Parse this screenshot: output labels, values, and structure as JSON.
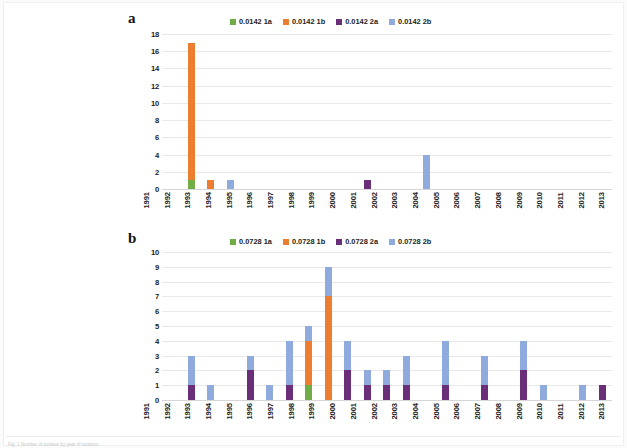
{
  "figure": {
    "caption": "Fig. 1 Number of isolates by year of isolation",
    "panel_a_letter": "a",
    "panel_b_letter": "b"
  },
  "colors": {
    "series_1a": "#70AD47",
    "series_1b": "#ED7D31",
    "series_2a": "#6B2F7A",
    "series_2b": "#8FAADC",
    "gridline": "#e9e9e9",
    "text": "#222222"
  },
  "chart_data": [
    {
      "type": "bar",
      "id": "panel-a",
      "panel": "a",
      "stacked": true,
      "title": "",
      "xlabel": "",
      "ylabel": "",
      "ylim": [
        0,
        18
      ],
      "ytick_step": 2,
      "yticks": [
        0,
        2,
        4,
        6,
        8,
        10,
        12,
        14,
        16,
        18
      ],
      "grid": true,
      "legend_position": "top",
      "categories": [
        "1991",
        "1992",
        "1993",
        "1994",
        "1995",
        "1996",
        "1997",
        "1998",
        "1999",
        "2000",
        "2001",
        "2002",
        "2003",
        "2004",
        "2005",
        "2006",
        "2007",
        "2008",
        "2009",
        "2010",
        "2011",
        "2012",
        "2013"
      ],
      "series": [
        {
          "name": "0.0142 1a",
          "color": "#70AD47",
          "values": [
            0,
            1,
            0,
            0,
            0,
            0,
            0,
            0,
            0,
            0,
            0,
            0,
            0,
            0,
            0,
            0,
            0,
            0,
            0,
            0,
            0,
            0,
            0
          ]
        },
        {
          "name": "0.0142 1b",
          "color": "#ED7D31",
          "values": [
            0,
            16,
            1,
            0,
            0,
            0,
            0,
            0,
            0,
            0,
            0,
            0,
            0,
            0,
            0,
            0,
            0,
            0,
            0,
            0,
            0,
            0,
            0
          ]
        },
        {
          "name": "0.0142 2a",
          "color": "#6B2F7A",
          "values": [
            0,
            0,
            0,
            0,
            0,
            0,
            0,
            0,
            0,
            0,
            1,
            0,
            0,
            0,
            0,
            0,
            0,
            0,
            0,
            0,
            0,
            0,
            0
          ]
        },
        {
          "name": "0.0142 2b",
          "color": "#8FAADC",
          "values": [
            0,
            0,
            0,
            1,
            0,
            0,
            0,
            0,
            0,
            0,
            0,
            0,
            0,
            4,
            0,
            0,
            0,
            0,
            0,
            0,
            0,
            0,
            0
          ]
        }
      ],
      "totals": [
        0,
        17,
        1,
        1,
        0,
        0,
        0,
        0,
        0,
        0,
        1,
        0,
        0,
        4,
        0,
        0,
        0,
        0,
        0,
        0,
        0,
        0,
        0
      ]
    },
    {
      "type": "bar",
      "id": "panel-b",
      "panel": "b",
      "stacked": true,
      "title": "",
      "xlabel": "",
      "ylabel": "",
      "ylim": [
        0,
        10
      ],
      "ytick_step": 1,
      "yticks": [
        0,
        1,
        2,
        3,
        4,
        5,
        6,
        7,
        8,
        9,
        10
      ],
      "grid": true,
      "legend_position": "top",
      "categories": [
        "1991",
        "1992",
        "1993",
        "1994",
        "1995",
        "1996",
        "1997",
        "1998",
        "1999",
        "2000",
        "2001",
        "2002",
        "2003",
        "2004",
        "2005",
        "2006",
        "2007",
        "2008",
        "2009",
        "2010",
        "2011",
        "2012",
        "2013"
      ],
      "series": [
        {
          "name": "0.0728 1a",
          "color": "#70AD47",
          "values": [
            0,
            0,
            0,
            0,
            0,
            0,
            0,
            1,
            0,
            0,
            0,
            0,
            0,
            0,
            0,
            0,
            0,
            0,
            0,
            0,
            0,
            0,
            0
          ]
        },
        {
          "name": "0.0728 1b",
          "color": "#ED7D31",
          "values": [
            0,
            0,
            0,
            0,
            0,
            0,
            0,
            3,
            7,
            0,
            0,
            0,
            0,
            0,
            0,
            0,
            0,
            0,
            0,
            0,
            0,
            0,
            0
          ]
        },
        {
          "name": "0.0728 2a",
          "color": "#6B2F7A",
          "values": [
            0,
            1,
            0,
            0,
            2,
            0,
            1,
            0,
            0,
            2,
            1,
            1,
            1,
            0,
            1,
            0,
            1,
            0,
            2,
            0,
            0,
            0,
            1
          ]
        },
        {
          "name": "0.0728 2b",
          "color": "#8FAADC",
          "values": [
            0,
            2,
            1,
            0,
            1,
            1,
            3,
            1,
            2,
            2,
            1,
            1,
            2,
            0,
            3,
            0,
            2,
            0,
            2,
            1,
            0,
            1,
            0
          ]
        }
      ],
      "totals": [
        0,
        3,
        1,
        0,
        3,
        1,
        4,
        5,
        9,
        4,
        2,
        2,
        3,
        0,
        4,
        0,
        3,
        0,
        4,
        1,
        0,
        1,
        1
      ]
    }
  ],
  "legend_a": {
    "items": [
      {
        "label": "0.0142 1a",
        "color": "#70AD47"
      },
      {
        "label": "0.0142 1b",
        "color": "#ED7D31"
      },
      {
        "label": "0.0142 2a",
        "color": "#6B2F7A"
      },
      {
        "label": "0.0142 2b",
        "color": "#8FAADC"
      }
    ]
  },
  "legend_b": {
    "items": [
      {
        "label": "0.0728 1a",
        "color": "#70AD47"
      },
      {
        "label": "0.0728 1b",
        "color": "#ED7D31"
      },
      {
        "label": "0.0728 2a",
        "color": "#6B2F7A"
      },
      {
        "label": "0.0728 2b",
        "color": "#8FAADC"
      }
    ]
  }
}
